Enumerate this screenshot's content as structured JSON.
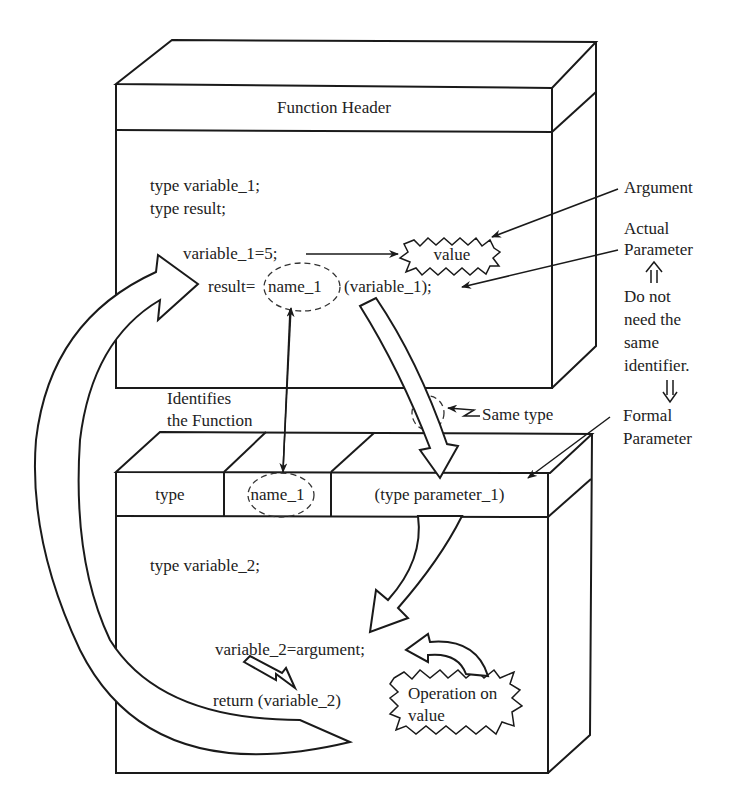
{
  "upper_block": {
    "header": "Function Header",
    "decl_1": "type variable_1;",
    "decl_2": "type result;",
    "assign": "variable_1=5;",
    "call_prefix": "result=",
    "call_name": "name_1",
    "call_args": "(variable_1);",
    "value_burst": "value"
  },
  "lower_block": {
    "header_cells": [
      "type",
      "name_1",
      "(type parameter_1)"
    ],
    "decl": "type variable_2;",
    "assign": "variable_2=argument;",
    "return_stmt": "return (variable_2)",
    "operation_burst_line1": "Operation on",
    "operation_burst_line2": "value"
  },
  "annotations": {
    "argument": "Argument",
    "actual_parameter_1": "Actual",
    "actual_parameter_2": "Parameter",
    "note_line1": "Do not",
    "note_line2": "need the",
    "note_line3": "same",
    "note_line4": "identifier.",
    "formal_parameter_1": "Formal",
    "formal_parameter_2": "Parameter",
    "identifies_1": "Identifies",
    "identifies_2": "the Function",
    "same_type": "Same type"
  },
  "colors": {
    "line": "#1a1a1a",
    "text": "#222222",
    "background": "#ffffff"
  }
}
